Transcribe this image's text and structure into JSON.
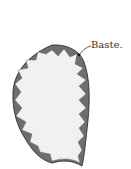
{
  "diagram": {
    "annotation": {
      "text": "Baste."
    },
    "colors": {
      "fabric_fill": "#f2f2f2",
      "stipple": "#9a9a9a",
      "notch_fill": "#6e6e6e",
      "outline": "#222222"
    }
  }
}
